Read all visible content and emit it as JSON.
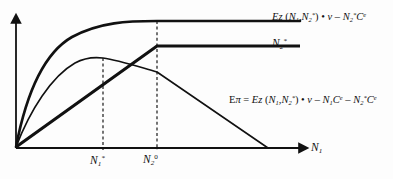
{
  "figure": {
    "background_color": "#fdfdfd",
    "ink_color": "#111111",
    "axes": {
      "x_axis_label": "N",
      "x_axis_label_sub": "1",
      "y_axis_label": "",
      "origin_px": [
        16,
        148
      ],
      "x_end_px": [
        305,
        148
      ],
      "y_end_px": [
        16,
        18
      ]
    },
    "ticks": [
      {
        "name": "tick-n1-star",
        "base": "N",
        "sub": "1",
        "sup": "*",
        "x_px": 103
      },
      {
        "name": "tick-n2-zero",
        "base": "N",
        "sub": "2",
        "sup": "0",
        "x_px": 157
      }
    ],
    "labels": {
      "top_curve": {
        "name": "expected-revenue-label",
        "parts": [
          {
            "t": "Ez",
            "style": "italic"
          },
          {
            "t": " (",
            "style": "upright"
          },
          {
            "t": "N",
            "style": "italic"
          },
          {
            "t": "1",
            "style": "sub"
          },
          {
            "t": ",",
            "style": "upright"
          },
          {
            "t": "N",
            "style": "italic"
          },
          {
            "t": "2",
            "style": "sub"
          },
          {
            "t": "*",
            "style": "sup"
          },
          {
            "t": ") • ",
            "style": "upright"
          },
          {
            "t": "v",
            "style": "italic"
          },
          {
            "t": " – ",
            "style": "upright"
          },
          {
            "t": "N",
            "style": "italic"
          },
          {
            "t": "2",
            "style": "sub"
          },
          {
            "t": "*",
            "style": "sup"
          },
          {
            "t": "C",
            "style": "italic"
          },
          {
            "t": "e",
            "style": "sup"
          }
        ],
        "plain": "Ez (N1,N2*) • v – N2*Ce"
      },
      "mid_line": {
        "name": "n2-star-label",
        "plain": "N2*"
      },
      "profit_curve": {
        "name": "expected-profit-label",
        "plain": "Eπ = Ez (N1,N2*) • v – N1Ce – N2*Ce"
      }
    },
    "curves": [
      {
        "name": "top-concave-curve",
        "role": "expected-revenue-net-of-N2-cost",
        "stroke_width": 2.4,
        "shape": "concave-increasing-then-flat",
        "plateau_y_px": 21,
        "flat_from_x_px": 157,
        "end_x_px": 300
      },
      {
        "name": "kinked-thick-line",
        "role": "N2-star-schedule",
        "stroke_width": 2.8,
        "shape": "linear-rise-then-flat",
        "kink_px": [
          157,
          46
        ],
        "flat_y_px": 46,
        "end_x_px": 300
      },
      {
        "name": "profit-curve",
        "role": "expected-profit",
        "stroke_width": 1.5,
        "shape": "concave-rise-peak-then-linear-fall",
        "peak_px": [
          103,
          58
        ],
        "kink_px": [
          157,
          72
        ],
        "zero_cross_px": [
          268,
          148
        ]
      }
    ]
  }
}
